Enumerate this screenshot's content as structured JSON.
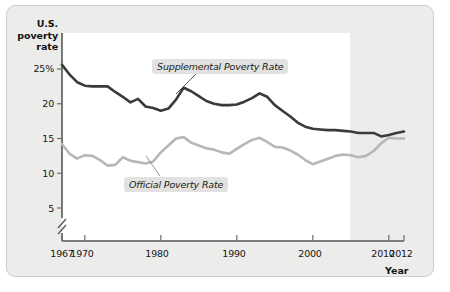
{
  "figure": {
    "y_axis_title_lines": [
      "U.S.",
      "poverty",
      "rate"
    ],
    "x_axis_title": "Year"
  },
  "chart_data": {
    "type": "line",
    "title": "",
    "xlabel": "Year",
    "ylabel": "U.S. poverty rate",
    "xlim": [
      1967,
      2012
    ],
    "ylim": [
      2.5,
      26.5
    ],
    "y_axis_broken": true,
    "grid": false,
    "legend_position": "inline-callouts",
    "ytick_labels": [
      "25%",
      "20",
      "15",
      "10",
      "5"
    ],
    "yticks": [
      25,
      20,
      15,
      10,
      5
    ],
    "xtick_labels": [
      "1967",
      "1970",
      "1980",
      "1990",
      "2000",
      "2010",
      "2012"
    ],
    "xticks": [
      1967,
      1970,
      1980,
      1990,
      2000,
      2010,
      2012
    ],
    "x": [
      1967,
      1968,
      1969,
      1970,
      1971,
      1972,
      1973,
      1974,
      1975,
      1976,
      1977,
      1978,
      1979,
      1980,
      1981,
      1982,
      1983,
      1984,
      1985,
      1986,
      1987,
      1988,
      1989,
      1990,
      1991,
      1992,
      1993,
      1994,
      1995,
      1996,
      1997,
      1998,
      1999,
      2000,
      2001,
      2002,
      2003,
      2004,
      2005,
      2006,
      2007,
      2008,
      2009,
      2010,
      2011,
      2012
    ],
    "series": [
      {
        "name": "Supplemental Poverty Rate",
        "color": "#3a3a3a",
        "values": [
          25.6,
          24.2,
          23.1,
          22.6,
          22.5,
          22.5,
          22.5,
          21.7,
          21.0,
          20.2,
          20.7,
          19.6,
          19.4,
          19.0,
          19.3,
          20.6,
          22.3,
          21.8,
          21.1,
          20.4,
          20.0,
          19.8,
          19.8,
          19.9,
          20.3,
          20.8,
          21.5,
          21.0,
          19.8,
          19.0,
          18.2,
          17.3,
          16.7,
          16.4,
          16.3,
          16.2,
          16.2,
          16.1,
          16.0,
          15.8,
          15.8,
          15.8,
          15.3,
          15.5,
          15.8,
          16.0
        ],
        "style": "thick"
      },
      {
        "name": "Official Poverty Rate",
        "color": "#b7b7b5",
        "values": [
          14.2,
          12.8,
          12.1,
          12.6,
          12.5,
          11.9,
          11.1,
          11.2,
          12.3,
          11.8,
          11.6,
          11.4,
          11.7,
          13.0,
          14.0,
          15.0,
          15.2,
          14.4,
          14.0,
          13.6,
          13.4,
          13.0,
          12.8,
          13.5,
          14.2,
          14.8,
          15.1,
          14.5,
          13.8,
          13.7,
          13.3,
          12.7,
          11.9,
          11.3,
          11.7,
          12.1,
          12.5,
          12.7,
          12.6,
          12.3,
          12.5,
          13.2,
          14.3,
          15.1,
          15.0,
          15.0
        ],
        "style": "thick"
      }
    ],
    "annotations": [
      {
        "text": "Supplemental Poverty Rate",
        "for_series": "Supplemental Poverty Rate"
      },
      {
        "text": "Official Poverty Rate",
        "for_series": "Official Poverty Rate"
      }
    ]
  }
}
